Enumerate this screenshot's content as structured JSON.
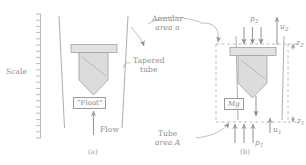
{
  "figure": {
    "colors": {
      "line": "#9b9b9b",
      "fill_float": "#dcdcdc",
      "fill_bar": "#e2e2e2",
      "text": "#8a8a8a",
      "dashed": "#a8a8a8",
      "background": "#ffffff"
    }
  },
  "panel_a": {
    "caption": "(a)",
    "scale_label": "Scale",
    "float_label": "“Float”",
    "tapered_tube_label_line1": "Tapered",
    "tapered_tube_label_line2": "tube",
    "flow_label": "Flow",
    "scale_tick_count": 20
  },
  "panel_b": {
    "caption": "(b)",
    "annular_area_line1": "Annular",
    "annular_area_line2": "area a",
    "tube_area_line1": "Tube",
    "tube_area_line2": "area  A",
    "weight_label": "Mg",
    "pressure_top": "p",
    "pressure_top_sub": "2",
    "pressure_bottom": "p",
    "pressure_bottom_sub": "1",
    "velocity_top": "u",
    "velocity_top_sub": "2",
    "velocity_bottom": "u",
    "velocity_bottom_sub": "1",
    "elevation_top": "z",
    "elevation_top_sub": "2",
    "elevation_bottom": "z",
    "elevation_bottom_sub": "1",
    "top_arrow_count": 3,
    "bottom_arrow_count": 3
  }
}
